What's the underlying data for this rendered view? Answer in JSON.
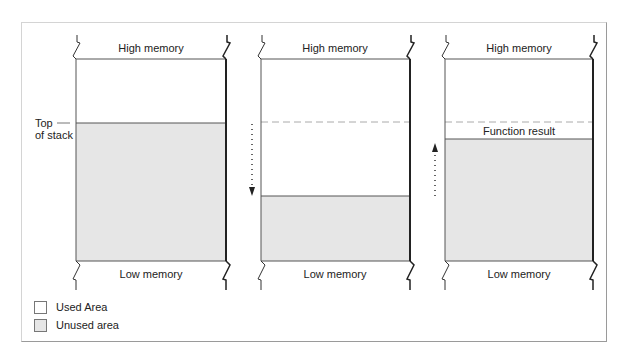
{
  "colors": {
    "unused_fill": "#e6e6e6",
    "used_fill": "#ffffff",
    "line": "#555555",
    "thick_line": "#222222",
    "dashed": "#aaaaaa"
  },
  "columns": [
    {
      "id": "before-call",
      "top_label": "High memory",
      "bottom_label": "Low memory",
      "side_label_line1": "Top",
      "side_label_line2": "of stack"
    },
    {
      "id": "during-call",
      "top_label": "High memory",
      "bottom_label": "Low memory",
      "arrow_direction": "down"
    },
    {
      "id": "after-call",
      "top_label": "High memory",
      "bottom_label": "Low memory",
      "arrow_direction": "up",
      "result_label": "Function result"
    }
  ],
  "legend": [
    {
      "label": "Used Area",
      "fill": "#ffffff"
    },
    {
      "label": "Unused area",
      "fill": "#e6e6e6"
    }
  ]
}
